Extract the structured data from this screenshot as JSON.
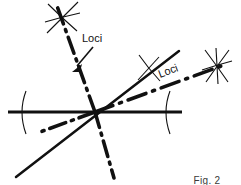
{
  "figure": {
    "caption": "Fig. 2",
    "background_color": "#ffffff",
    "ink_color": "#111111",
    "labels": [
      {
        "id": "loci-left",
        "text": "Loci",
        "x": 82,
        "y": 42,
        "rotation": 0
      },
      {
        "id": "loci-right",
        "text": "Loci",
        "x": 160,
        "y": 78,
        "rotation": -21
      }
    ],
    "annotations": {
      "arrow_from": "loci-left",
      "arrow_to": "upper-left-dashdot-line"
    },
    "geometry": {
      "center": {
        "x": 95,
        "y": 112
      },
      "solid_lines": [
        {
          "name": "horizontal-baseline",
          "x1": 8,
          "y1": 112,
          "x2": 182,
          "y2": 112,
          "width": 2.6
        },
        {
          "name": "diagonal-lower-left-to-upper-right",
          "x1": 16,
          "y1": 177,
          "x2": 179,
          "y2": 51,
          "width": 2.4
        }
      ],
      "dashdot_lines": [
        {
          "name": "upper-left-dashdot-line",
          "x1": 95,
          "y1": 112,
          "x2": 57,
          "y2": 8,
          "width": 3.4
        },
        {
          "name": "right-dashdot-line",
          "x1": 95,
          "y1": 112,
          "x2": 222,
          "y2": 66,
          "width": 3.4
        },
        {
          "name": "lower-left-dashdot-stub",
          "x1": 95,
          "y1": 112,
          "x2": 42,
          "y2": 131,
          "width": 3.4
        },
        {
          "name": "lower-right-dashdot-line",
          "x1": 95,
          "y1": 112,
          "x2": 113,
          "y2": 174,
          "width": 3.4
        }
      ],
      "arc_ticks": [
        {
          "name": "arc-tick-left-baseline",
          "cx": 22,
          "cy": 112,
          "rx": 5,
          "ry": 22
        },
        {
          "name": "arc-tick-right-baseline",
          "cx": 166,
          "cy": 112,
          "rx": 5,
          "ry": 22
        },
        {
          "name": "arc-tick-upper-right-diagonal",
          "cx": 150,
          "cy": 68,
          "rotation": 38
        }
      ],
      "star_markers": [
        {
          "name": "star-marker-upper-left",
          "cx": 62,
          "cy": 18
        },
        {
          "name": "star-marker-upper-right",
          "cx": 217,
          "cy": 66
        }
      ],
      "arrow": {
        "name": "loci-pointer-arrow",
        "x1": 92,
        "y1": 48,
        "x2": 74,
        "y2": 70
      }
    }
  }
}
